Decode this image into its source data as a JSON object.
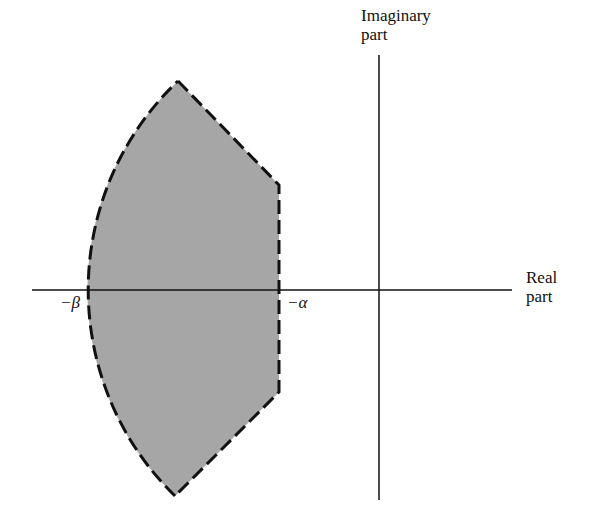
{
  "diagram": {
    "axes": {
      "imaginary_label_line1": "Imaginary",
      "imaginary_label_line2": "part",
      "real_label_line1": "Real",
      "real_label_line2": "part"
    },
    "markers": {
      "beta": "−β",
      "alpha": "−α"
    },
    "colors": {
      "region_fill": "#a6a6a6",
      "outline": "#111111",
      "axis": "#111111"
    }
  }
}
